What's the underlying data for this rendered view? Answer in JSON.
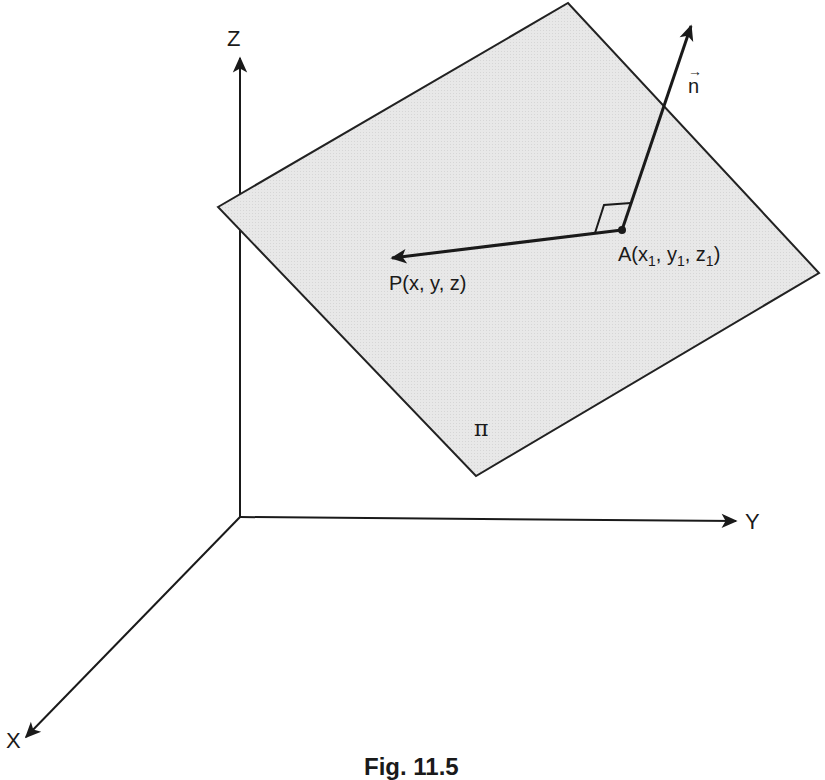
{
  "figure": {
    "caption": "Fig. 11.5",
    "axes": {
      "x_label": "X",
      "y_label": "Y",
      "z_label": "Z"
    },
    "plane": {
      "label": "π",
      "fill_color": "#e6e6e6",
      "edge_color": "#222222"
    },
    "normal_vector": {
      "label": "n",
      "arrow_glyph": "→"
    },
    "points": {
      "A": {
        "prefix": "A(x",
        "sub1": "1",
        "mid1": ", y",
        "sub2": "1",
        "mid2": ", z",
        "sub3": "1",
        "suffix": ")"
      },
      "P": {
        "label": "P(x, y, z)"
      }
    },
    "ink_color": "#1a1a1a"
  }
}
